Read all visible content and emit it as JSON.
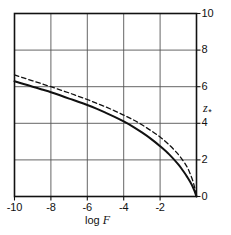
{
  "chart_data": {
    "type": "line",
    "title": "",
    "xlabel": "log F",
    "ylabel": "z*",
    "xlim": [
      -10,
      0
    ],
    "ylim": [
      0,
      10
    ],
    "grid": true,
    "legend": "none",
    "xticks": [
      -10,
      -8,
      -6,
      -4,
      -2
    ],
    "xtick_labels": [
      "-10",
      "-8",
      "-6",
      "-4",
      "-2"
    ],
    "yticks": [
      0,
      2,
      4,
      6,
      8,
      10
    ],
    "ytick_labels": [
      "0",
      "2",
      "4",
      "6",
      "8",
      "10"
    ],
    "ytick_side": "right",
    "series": [
      {
        "name": "solid-curve",
        "style": "solid",
        "color": "#111111",
        "x": [
          -10.0,
          -9.5,
          -9.0,
          -8.5,
          -8.0,
          -7.5,
          -7.0,
          -6.5,
          -6.0,
          -5.5,
          -5.0,
          -4.5,
          -4.0,
          -3.5,
          -3.0,
          -2.5,
          -2.0,
          -1.5,
          -1.0,
          -0.7,
          -0.5,
          -0.35,
          -0.2,
          -0.1,
          0.0
        ],
        "y": [
          6.3,
          6.15,
          6.0,
          5.85,
          5.7,
          5.53,
          5.35,
          5.18,
          5.0,
          4.8,
          4.58,
          4.35,
          4.1,
          3.82,
          3.5,
          3.15,
          2.75,
          2.3,
          1.75,
          1.35,
          1.05,
          0.8,
          0.52,
          0.28,
          0.0
        ]
      },
      {
        "name": "dashed-curve",
        "style": "dashed",
        "color": "#111111",
        "x": [
          -10.0,
          -9.5,
          -9.0,
          -8.5,
          -8.0,
          -7.5,
          -7.0,
          -6.5,
          -6.0,
          -5.5,
          -5.0,
          -4.5,
          -4.0,
          -3.5,
          -3.0,
          -2.5,
          -2.0,
          -1.5,
          -1.0,
          -0.7,
          -0.5,
          -0.35,
          -0.2,
          -0.1,
          0.0
        ],
        "y": [
          6.65,
          6.48,
          6.32,
          6.16,
          6.0,
          5.83,
          5.66,
          5.48,
          5.3,
          5.1,
          4.9,
          4.68,
          4.45,
          4.2,
          3.92,
          3.6,
          3.25,
          2.82,
          2.3,
          1.9,
          1.58,
          1.25,
          0.85,
          0.48,
          0.0
        ]
      }
    ]
  },
  "axes": {
    "x_title": "log",
    "x_title_var": "F",
    "y_title_var": "z",
    "y_title_sub": "*"
  },
  "colors": {
    "frame": "#111111",
    "grid": "#555555",
    "curve": "#111111",
    "background": "#ffffff"
  }
}
